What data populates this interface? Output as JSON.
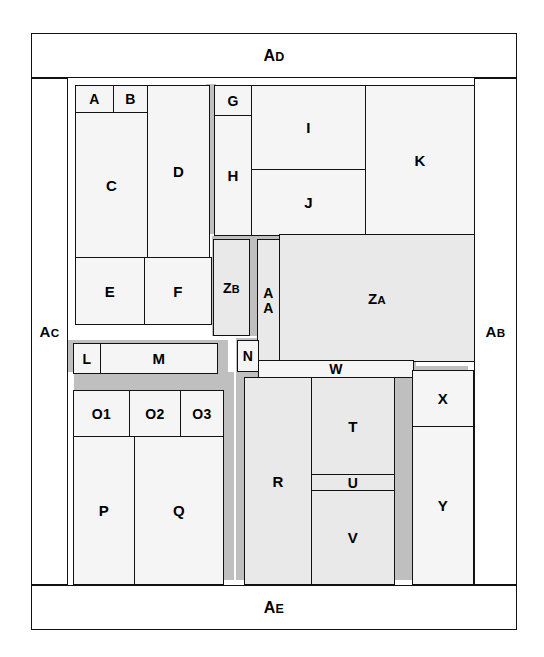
{
  "diagram": {
    "background_color": "#ffffff",
    "frame_color": "#111111",
    "fill_light": "#f5f5f5",
    "fill_mid": "#e9e9e9",
    "shadow_color": "#bfbfbf"
  },
  "border_labels": {
    "top": {
      "head": "A",
      "tail": "D"
    },
    "bottom": {
      "head": "A",
      "tail": "E"
    },
    "left": {
      "head": "A",
      "tail": "C"
    },
    "right": {
      "head": "A",
      "tail": "B"
    }
  },
  "regions": [
    {
      "id": "A",
      "label": "A",
      "head": "A",
      "tail": ""
    },
    {
      "id": "B",
      "label": "B",
      "head": "B",
      "tail": ""
    },
    {
      "id": "C",
      "label": "C",
      "head": "C",
      "tail": ""
    },
    {
      "id": "D",
      "label": "D",
      "head": "D",
      "tail": ""
    },
    {
      "id": "E",
      "label": "E",
      "head": "E",
      "tail": ""
    },
    {
      "id": "F",
      "label": "F",
      "head": "F",
      "tail": ""
    },
    {
      "id": "G",
      "label": "G",
      "head": "G",
      "tail": ""
    },
    {
      "id": "H",
      "label": "H",
      "head": "H",
      "tail": ""
    },
    {
      "id": "I",
      "label": "I",
      "head": "I",
      "tail": ""
    },
    {
      "id": "J",
      "label": "J",
      "head": "J",
      "tail": ""
    },
    {
      "id": "K",
      "label": "K",
      "head": "K",
      "tail": ""
    },
    {
      "id": "L",
      "label": "L",
      "head": "L",
      "tail": ""
    },
    {
      "id": "M",
      "label": "M",
      "head": "M",
      "tail": ""
    },
    {
      "id": "N",
      "label": "N",
      "head": "N",
      "tail": ""
    },
    {
      "id": "O1",
      "label": "O1",
      "head": "O1",
      "tail": ""
    },
    {
      "id": "O2",
      "label": "O2",
      "head": "O2",
      "tail": ""
    },
    {
      "id": "O3",
      "label": "O3",
      "head": "O3",
      "tail": ""
    },
    {
      "id": "P",
      "label": "P",
      "head": "P",
      "tail": ""
    },
    {
      "id": "Q",
      "label": "Q",
      "head": "Q",
      "tail": ""
    },
    {
      "id": "R",
      "label": "R",
      "head": "R",
      "tail": ""
    },
    {
      "id": "T",
      "label": "T",
      "head": "T",
      "tail": ""
    },
    {
      "id": "U",
      "label": "U",
      "head": "U",
      "tail": ""
    },
    {
      "id": "V",
      "label": "V",
      "head": "V",
      "tail": ""
    },
    {
      "id": "W",
      "label": "W",
      "head": "W",
      "tail": ""
    },
    {
      "id": "X",
      "label": "X",
      "head": "X",
      "tail": ""
    },
    {
      "id": "Y",
      "label": "Y",
      "head": "Y",
      "tail": ""
    },
    {
      "id": "ZA",
      "label": "ZA",
      "head": "Z",
      "tail": "A"
    },
    {
      "id": "ZB",
      "label": "ZB",
      "head": "Z",
      "tail": "B"
    },
    {
      "id": "AA",
      "label": "AA",
      "head": "A",
      "tail": "A"
    }
  ]
}
